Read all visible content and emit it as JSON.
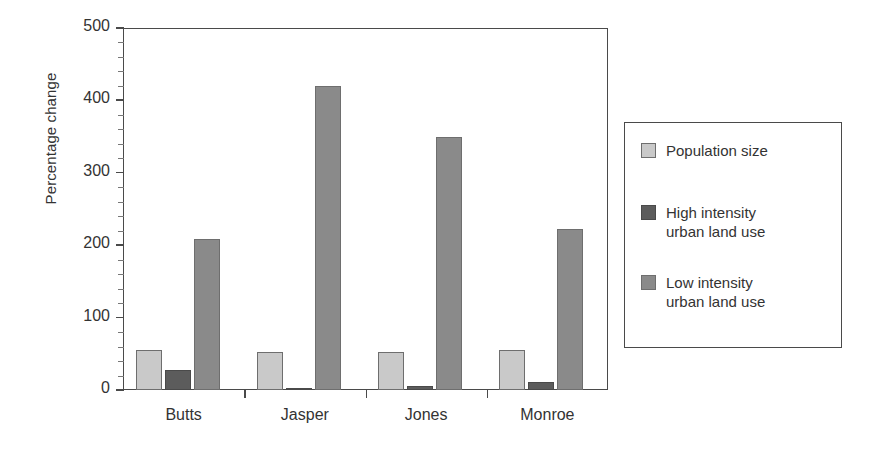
{
  "chart_data": {
    "type": "bar",
    "title": "",
    "subtitle": "",
    "xlabel": "",
    "ylabel": "Percentage change",
    "ylim": [
      0,
      500
    ],
    "yticks": [
      0,
      100,
      200,
      300,
      400,
      500
    ],
    "ytick_labels": [
      "0",
      "100",
      "200",
      "300",
      "400",
      "500"
    ],
    "grid": false,
    "legend_position": "right",
    "categories": [
      "Butts",
      "Jasper",
      "Jones",
      "Monroe"
    ],
    "series": [
      {
        "name": "Population size",
        "color": "#c9c9c9",
        "values": [
          55,
          52,
          53,
          55
        ]
      },
      {
        "name": "High intensity\nurban land use",
        "color": "#5c5c5c",
        "values": [
          28,
          3,
          6,
          11
        ]
      },
      {
        "name": "Low intensity\nurban land use",
        "color": "#8a8a8a",
        "values": [
          208,
          420,
          350,
          222
        ]
      }
    ]
  },
  "axes": {
    "y_title": "Percentage change",
    "y_labels": [
      "500",
      "400",
      "300",
      "200",
      "100",
      "0"
    ],
    "x_labels": [
      "Butts",
      "Jasper",
      "Jones",
      "Monroe"
    ]
  },
  "legend": {
    "items": [
      {
        "label": "Population size",
        "swatch": "series-pop"
      },
      {
        "label": "High intensity\nurban land use",
        "swatch": "series-high"
      },
      {
        "label": "Low intensity\nurban land use",
        "swatch": "series-low"
      }
    ]
  }
}
